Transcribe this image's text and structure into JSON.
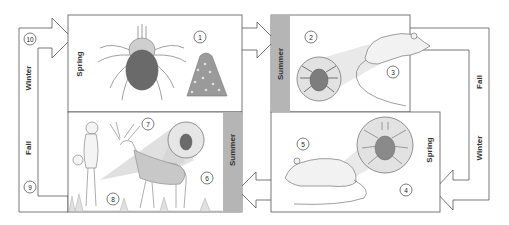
{
  "diagram": {
    "colors": {
      "line": "#555555",
      "season_strip": "#b5b5b5",
      "tick_body": "#6a6a6a",
      "lens": "#dcdcdc"
    },
    "panels": [
      {
        "id": "top-left",
        "season": "Spring",
        "numbers": [
          "1"
        ],
        "content": "adult tick and egg mass"
      },
      {
        "id": "top-right",
        "season": "Summer",
        "numbers": [
          "2",
          "3"
        ],
        "content": "larva feeding on mouse"
      },
      {
        "id": "bottom-right",
        "season": "Spring",
        "numbers": [
          "4",
          "5"
        ],
        "content": "nymph feeding on mouse"
      },
      {
        "id": "bottom-left",
        "season": "Summer",
        "numbers": [
          "6",
          "7",
          "8"
        ],
        "content": "adult tick on deer and human"
      }
    ],
    "loops": {
      "left": {
        "labels": [
          "Winter",
          "Fall"
        ],
        "numbers": [
          "10",
          "9"
        ]
      },
      "right": {
        "labels": [
          "Fall",
          "Winter"
        ]
      }
    },
    "labels": {
      "tl_season": "Spring",
      "tr_season": "Summer",
      "br_season": "Spring",
      "bl_season": "Summer",
      "left_winter": "Winter",
      "left_fall": "Fall",
      "right_fall": "Fall",
      "right_winter": "Winter",
      "n1": "1",
      "n2": "2",
      "n3": "3",
      "n4": "4",
      "n5": "5",
      "n6": "6",
      "n7": "7",
      "n8": "8",
      "n9": "9",
      "n10": "10"
    }
  }
}
